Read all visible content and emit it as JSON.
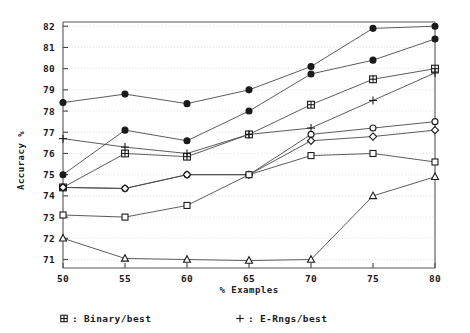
{
  "chart_data": {
    "type": "line",
    "title": "",
    "xlabel": "% Examples",
    "ylabel": "Accuracy %",
    "x": [
      50,
      55,
      60,
      65,
      70,
      75,
      80
    ],
    "xticks": [
      "50",
      "55",
      "60",
      "65",
      "70",
      "75",
      "80"
    ],
    "yticks": [
      "71",
      "72",
      "73",
      "74",
      "75",
      "76",
      "77",
      "78",
      "79",
      "80",
      "81",
      "82"
    ],
    "xlim": [
      50,
      80
    ],
    "ylim": [
      70.6,
      82.2
    ],
    "grid": true,
    "legend_position": "below-plot",
    "series": [
      {
        "name": "filled-circle-upper",
        "marker": "filled-circle",
        "values": [
          78.4,
          78.8,
          78.35,
          79.0,
          80.1,
          81.9,
          82.0
        ]
      },
      {
        "name": "filled-circle-lower",
        "marker": "filled-circle",
        "values": [
          75.0,
          77.1,
          76.6,
          78.0,
          79.75,
          80.4,
          81.4
        ]
      },
      {
        "name": "Binary/best",
        "marker": "grid-square",
        "values": [
          74.4,
          76.0,
          75.85,
          76.9,
          78.3,
          79.5,
          80.0
        ]
      },
      {
        "name": "E-Rngs/best",
        "marker": "plus",
        "values": [
          76.7,
          76.3,
          76.0,
          76.9,
          77.2,
          78.5,
          79.8
        ]
      },
      {
        "name": "open-circle",
        "marker": "open-circle",
        "values": [
          74.4,
          74.35,
          75.0,
          75.0,
          76.9,
          77.2,
          77.5
        ]
      },
      {
        "name": "diamond",
        "marker": "diamond",
        "values": [
          74.4,
          74.35,
          75.0,
          75.0,
          76.6,
          76.8,
          77.1
        ]
      },
      {
        "name": "open-square",
        "marker": "open-square",
        "values": [
          73.1,
          73.0,
          73.55,
          75.0,
          75.9,
          76.0,
          75.6
        ]
      },
      {
        "name": "triangle",
        "marker": "triangle",
        "values": [
          72.0,
          71.05,
          71.0,
          70.95,
          71.0,
          74.0,
          74.9
        ]
      }
    ],
    "legend": [
      {
        "marker": "grid-square",
        "label": "Binary/best"
      },
      {
        "marker": "plus",
        "label": "E-Rngs/best"
      }
    ]
  }
}
